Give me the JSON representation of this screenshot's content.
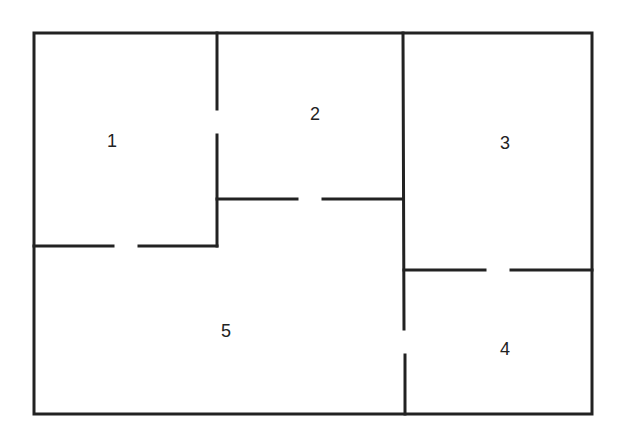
{
  "diagram": {
    "type": "floor-plan",
    "colors": {
      "wall": "#222222",
      "background": "#ffffff"
    },
    "rooms": [
      {
        "id": "1",
        "label": "1",
        "x": 112,
        "y": 142
      },
      {
        "id": "2",
        "label": "2",
        "x": 315,
        "y": 121
      },
      {
        "id": "3",
        "label": "3",
        "x": 505,
        "y": 150
      },
      {
        "id": "4",
        "label": "4",
        "x": 505,
        "y": 357
      },
      {
        "id": "5",
        "label": "5",
        "x": 226,
        "y": 338
      }
    ],
    "doors": [
      {
        "between": [
          "1",
          "2"
        ]
      },
      {
        "between": [
          "1",
          "5"
        ]
      },
      {
        "between": [
          "2",
          "5"
        ]
      },
      {
        "between": [
          "3",
          "4"
        ]
      },
      {
        "between": [
          "4",
          "5"
        ]
      }
    ]
  }
}
